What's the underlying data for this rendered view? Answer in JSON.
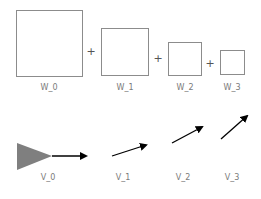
{
  "colors": {
    "box_stroke": "#8c8c8c",
    "label": "#7a7a7a",
    "plus": "#555555",
    "triangle_fill": "#7f7f7f",
    "arrow": "#000000"
  },
  "weights": [
    {
      "label": "W_0",
      "x": 16,
      "y": 10,
      "size": 66
    },
    {
      "label": "W_1",
      "x": 101,
      "y": 28,
      "size": 47
    },
    {
      "label": "W_2",
      "x": 168,
      "y": 42,
      "size": 33
    },
    {
      "label": "W_3",
      "x": 220,
      "y": 50,
      "size": 24
    }
  ],
  "operators": [
    {
      "symbol": "+",
      "x": 91,
      "y": 55
    },
    {
      "symbol": "+",
      "x": 158,
      "y": 62
    },
    {
      "symbol": "+",
      "x": 210,
      "y": 67
    }
  ],
  "vectors": [
    {
      "label": "V_0",
      "label_x": 48,
      "x1": 52,
      "y1": 156,
      "x2": 86,
      "y2": 156,
      "has_triangle": true
    },
    {
      "label": "V_1",
      "label_x": 123,
      "x1": 112,
      "y1": 156,
      "x2": 146,
      "y2": 145
    },
    {
      "label": "V_2",
      "label_x": 183,
      "x1": 172,
      "y1": 143,
      "x2": 202,
      "y2": 127
    },
    {
      "label": "V_3",
      "label_x": 232,
      "x1": 221,
      "y1": 139,
      "x2": 247,
      "y2": 116
    }
  ]
}
